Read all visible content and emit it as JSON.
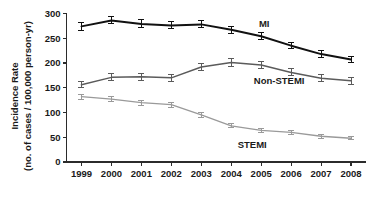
{
  "chart_data": {
    "type": "line",
    "title": "",
    "xlabel": "",
    "ylabel_line1": "Incidence Rate",
    "ylabel_line2": "(no. of cases / 100,000 person-yr)",
    "categories": [
      "1999",
      "2000",
      "2001",
      "2002",
      "2003",
      "2004",
      "2005",
      "2006",
      "2007",
      "2008"
    ],
    "x": [
      1999,
      2000,
      2001,
      2002,
      2003,
      2004,
      2005,
      2006,
      2007,
      2008
    ],
    "xlim": [
      1998.5,
      2008.5
    ],
    "ylim": [
      0,
      300
    ],
    "yticks": [
      0,
      50,
      100,
      150,
      200,
      250,
      300
    ],
    "xticks": [
      "1999",
      "2000",
      "2001",
      "2002",
      "2003",
      "2004",
      "2005",
      "2006",
      "2007",
      "2008"
    ],
    "grid": false,
    "legend_position": "inline-annotations",
    "series": [
      {
        "name": "MI",
        "color": "#111111",
        "label_text": "MI",
        "values": [
          274,
          286,
          279,
          276,
          278,
          267,
          254,
          235,
          218,
          207
        ],
        "error_low": [
          266,
          279,
          272,
          269,
          271,
          260,
          247,
          229,
          212,
          201
        ],
        "error_high": [
          282,
          293,
          287,
          283,
          286,
          274,
          261,
          242,
          225,
          214
        ]
      },
      {
        "name": "Non-STEMI",
        "color": "#5b5b5b",
        "label_text": "Non-STEMI",
        "values": [
          156,
          171,
          172,
          170,
          192,
          201,
          196,
          181,
          169,
          164
        ],
        "error_low": [
          150,
          164,
          165,
          163,
          185,
          193,
          189,
          174,
          162,
          157
        ],
        "error_high": [
          162,
          178,
          179,
          177,
          199,
          209,
          203,
          188,
          176,
          171
        ]
      },
      {
        "name": "STEMI",
        "color": "#9a9a9a",
        "label_text": "STEMI",
        "values": [
          132,
          127,
          120,
          116,
          95,
          73,
          64,
          60,
          52,
          48
        ],
        "error_low": [
          127,
          122,
          115,
          111,
          90,
          69,
          60,
          56,
          48,
          45
        ],
        "error_high": [
          137,
          132,
          125,
          121,
          100,
          77,
          68,
          64,
          56,
          51
        ]
      }
    ],
    "annotations": [
      {
        "text": "MI",
        "x": 2005.1,
        "y": 272
      },
      {
        "text": "Non-STEMI",
        "x": 2005.6,
        "y": 158
      },
      {
        "text": "STEMI",
        "x": 2004.7,
        "y": 28
      }
    ],
    "axis_color": "#2b2b2b"
  }
}
